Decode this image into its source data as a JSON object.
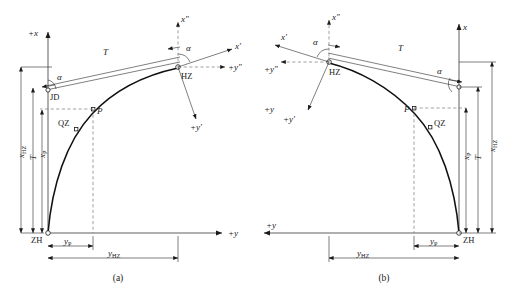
{
  "figure": {
    "background_color": "#ffffff",
    "line_color": "#1a1a1a",
    "dashed_color": "#7a7a7a"
  },
  "panels": [
    {
      "id": "a",
      "caption": "(a)",
      "axes": {
        "vertical_positive": "+x",
        "horizontal_positive": "+y",
        "tangent_x": "x′",
        "tangent_y": "+y′",
        "chord_x": "x″",
        "chord_y": "+y″"
      },
      "points": [
        {
          "name": "ZH",
          "label": "ZH"
        },
        {
          "name": "QZ",
          "label": "QZ"
        },
        {
          "name": "P",
          "label": "P"
        },
        {
          "name": "HZ",
          "label": "HZ"
        },
        {
          "name": "JD",
          "label": "JD"
        }
      ],
      "angles": [
        {
          "name": "alpha-at-jd",
          "label": "α"
        },
        {
          "name": "alpha-at-hz",
          "label": "α"
        }
      ],
      "dimensions": [
        {
          "name": "tangent-length",
          "label": "T",
          "sub": ""
        },
        {
          "name": "x-hz",
          "label": "x",
          "sub": "HZ"
        },
        {
          "name": "t-vertical",
          "label": "T",
          "sub": ""
        },
        {
          "name": "x-p",
          "label": "x",
          "sub": "P"
        },
        {
          "name": "y-p",
          "label": "y",
          "sub": "P"
        },
        {
          "name": "y-hz",
          "label": "y",
          "sub": "HZ"
        }
      ]
    },
    {
      "id": "b",
      "caption": "(b)",
      "axes": {
        "vertical_positive": "x",
        "horizontal_positive": "+y",
        "horizontal_positive_upper": "+y",
        "tangent_x": "x′",
        "tangent_y": "+y′",
        "chord_x": "x″",
        "chord_y": "+y″"
      },
      "points": [
        {
          "name": "ZH",
          "label": "ZH"
        },
        {
          "name": "QZ",
          "label": "QZ"
        },
        {
          "name": "P",
          "label": "P"
        },
        {
          "name": "HZ",
          "label": "HZ"
        }
      ],
      "angles": [
        {
          "name": "alpha-at-hz",
          "label": "α"
        },
        {
          "name": "alpha-at-jd",
          "label": "α"
        }
      ],
      "dimensions": [
        {
          "name": "tangent-length",
          "label": "T",
          "sub": ""
        },
        {
          "name": "x-p",
          "label": "x",
          "sub": "P"
        },
        {
          "name": "t-vertical",
          "label": "T",
          "sub": ""
        },
        {
          "name": "x-hz",
          "label": "x",
          "sub": "HZ"
        },
        {
          "name": "y-p",
          "label": "y",
          "sub": "P"
        },
        {
          "name": "y-hz",
          "label": "y",
          "sub": "HZ"
        }
      ]
    }
  ]
}
